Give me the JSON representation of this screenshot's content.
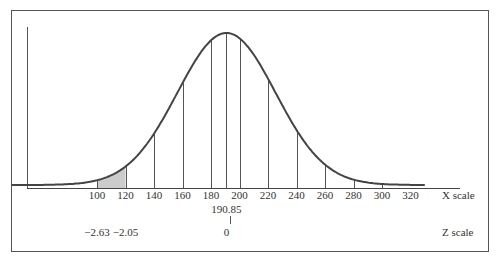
{
  "chart_data": {
    "type": "area",
    "title": "",
    "distribution": {
      "mean": 190.85,
      "sd": 34.5
    },
    "x_axis": {
      "label": "X scale",
      "ticks": [
        100,
        120,
        140,
        160,
        180,
        200,
        220,
        240,
        260,
        280,
        300,
        320
      ],
      "mean_label": "190.85"
    },
    "z_axis": {
      "label": "Z scale",
      "ticks": [
        {
          "x": 100,
          "label": "−2.63"
        },
        {
          "x": 120,
          "label": "−2.05"
        },
        {
          "x": 190.85,
          "label": "0"
        }
      ]
    },
    "shaded_region": {
      "from": 100,
      "to": 120,
      "color": "#cccccc"
    },
    "vertical_lines": [
      100,
      120,
      140,
      160,
      180,
      190.85,
      200,
      220,
      240,
      260,
      280,
      300
    ],
    "grid": false,
    "legend": null
  },
  "colors": {
    "stroke": "#444444",
    "frame": "#555555",
    "shade": "#cccccc"
  }
}
